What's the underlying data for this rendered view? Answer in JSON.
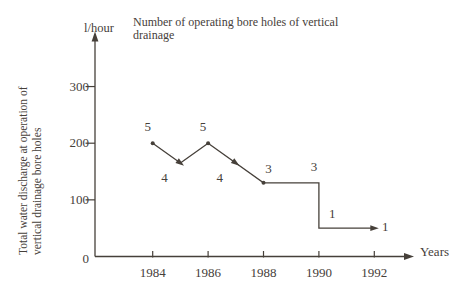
{
  "chart_data": {
    "type": "line",
    "title": "Number of operating bore holes of vertical drainage",
    "title_lines": [
      "Number of operating bore holes of vertical",
      "drainage"
    ],
    "unit_label": "l/hour",
    "xlabel": "Years",
    "ylabel": "Total water discharge at operation of vertical drainage bore holes",
    "ylabel_lines": [
      "Total water discharge at operation of",
      "vertical drainage bore holes"
    ],
    "x_ticks": [
      "1984",
      "1986",
      "1988",
      "1990",
      "1992"
    ],
    "y_ticks": [
      "0",
      "100",
      "200",
      "300"
    ],
    "xlim": [
      1982,
      1993.5
    ],
    "ylim": [
      0,
      390
    ],
    "grid": false,
    "legend": "none",
    "line_points": [
      {
        "year": 1984,
        "value": 200
      },
      {
        "year": 1985,
        "value": 165
      },
      {
        "year": 1986,
        "value": 200
      },
      {
        "year": 1988,
        "value": 130
      },
      {
        "year": 1990,
        "value": 130
      },
      {
        "year": 1990,
        "value": 50
      },
      {
        "year": 1992,
        "value": 50
      }
    ],
    "dot_markers": [
      {
        "year": 1984,
        "value": 200
      },
      {
        "year": 1986,
        "value": 200
      },
      {
        "year": 1988,
        "value": 130
      }
    ],
    "arrow_markers": [
      {
        "year": 1985,
        "value": 165,
        "direction": "down-right"
      },
      {
        "year": 1987,
        "value": 165,
        "direction": "down-right"
      },
      {
        "year": 1992,
        "value": 50,
        "direction": "right"
      }
    ],
    "annotations": [
      {
        "label": "5",
        "year": 1984,
        "value": 200,
        "placement": "above"
      },
      {
        "label": "4",
        "year": 1985,
        "value": 165,
        "placement": "below"
      },
      {
        "label": "5",
        "year": 1986,
        "value": 200,
        "placement": "above"
      },
      {
        "label": "4",
        "year": 1987,
        "value": 165,
        "placement": "below"
      },
      {
        "label": "3",
        "year": 1988,
        "value": 130,
        "placement": "above-right"
      },
      {
        "label": "3",
        "year": 1990,
        "value": 130,
        "placement": "above"
      },
      {
        "label": "1",
        "year": 1990.3,
        "value": 50,
        "placement": "above-right"
      },
      {
        "label": "1",
        "year": 1992,
        "value": 50,
        "placement": "right"
      }
    ],
    "colors": {
      "ink": "#46403a",
      "background": "#ffffff"
    }
  }
}
